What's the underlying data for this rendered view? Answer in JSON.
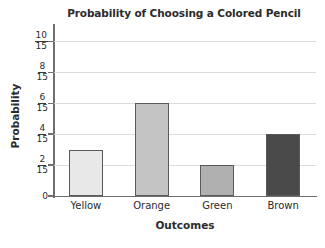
{
  "chart_data": {
    "type": "bar",
    "title": "Probability of Choosing a Colored Pencil",
    "xlabel": "Outcomes",
    "ylabel": "Probability",
    "categories": [
      "Yellow",
      "Orange",
      "Green",
      "Brown"
    ],
    "values": [
      0.2,
      0.4,
      0.1333,
      0.2667
    ],
    "value_labels": [
      "3/15",
      "6/15",
      "2/15",
      "4/15"
    ],
    "bar_colors": [
      "#e8e8e8",
      "#c4c4c4",
      "#b0b0b0",
      "#4a4a4a"
    ],
    "bar_border_color": "#5a5a5a",
    "ylim": [
      0,
      0.7333
    ],
    "grid": true,
    "legend": "none",
    "yticks": [
      {
        "value": 0,
        "numerator": "0",
        "denominator": ""
      },
      {
        "value": 0.1333,
        "numerator": "2",
        "denominator": "15"
      },
      {
        "value": 0.2667,
        "numerator": "4",
        "denominator": "15"
      },
      {
        "value": 0.4,
        "numerator": "6",
        "denominator": "15"
      },
      {
        "value": 0.5333,
        "numerator": "8",
        "denominator": "15"
      },
      {
        "value": 0.6667,
        "numerator": "10",
        "denominator": "15"
      }
    ]
  }
}
